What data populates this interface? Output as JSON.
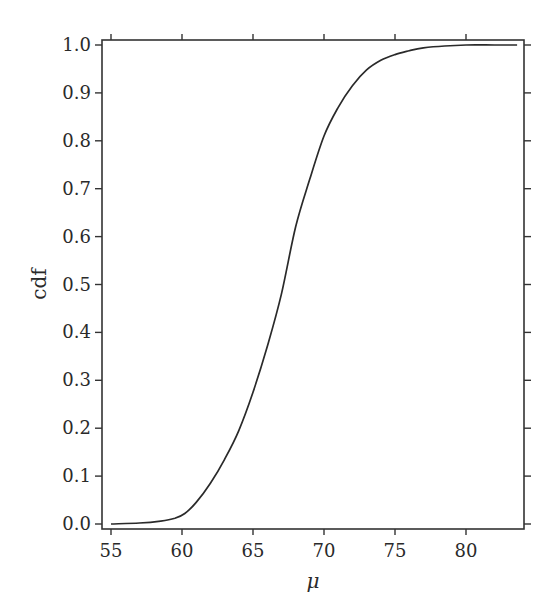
{
  "chart_data": {
    "type": "line",
    "title": "",
    "xlabel": "μ",
    "ylabel": "cdf",
    "xlim": [
      54.6,
      84.3
    ],
    "ylim": [
      -0.01,
      1.01
    ],
    "grid": false,
    "legend": null,
    "x_ticks": [
      55,
      60,
      65,
      70,
      75,
      80
    ],
    "x_tick_labels": [
      "55",
      "60",
      "65",
      "70",
      "75",
      "80"
    ],
    "y_ticks": [
      0.0,
      0.1,
      0.2,
      0.3,
      0.4,
      0.5,
      0.6,
      0.7,
      0.8,
      0.9,
      1.0
    ],
    "y_tick_labels": [
      "0.0",
      "0.1",
      "0.2",
      "0.3",
      "0.4",
      "0.5",
      "0.6",
      "0.7",
      "0.8",
      "0.9",
      "1.0"
    ],
    "series": [
      {
        "name": "cdf",
        "x": [
          55.0,
          57.0,
          58.5,
          59.5,
          60.2,
          61.0,
          62.0,
          63.0,
          64.0,
          65.0,
          66.0,
          67.0,
          68.0,
          69.0,
          70.0,
          71.0,
          72.0,
          73.0,
          74.0,
          75.0,
          76.0,
          77.0,
          78.5,
          80.0,
          82.0,
          83.6
        ],
        "values": [
          0.0,
          0.002,
          0.006,
          0.012,
          0.022,
          0.045,
          0.085,
          0.135,
          0.195,
          0.275,
          0.37,
          0.48,
          0.62,
          0.72,
          0.81,
          0.87,
          0.915,
          0.948,
          0.968,
          0.98,
          0.988,
          0.994,
          0.998,
          1.0,
          1.0,
          1.0
        ]
      }
    ]
  }
}
